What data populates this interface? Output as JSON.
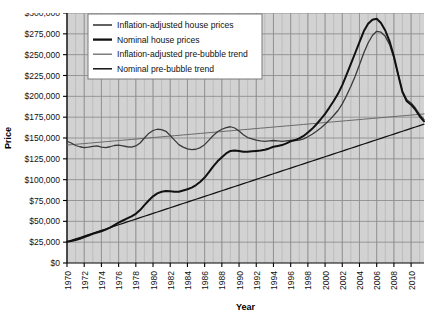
{
  "chart_data": {
    "type": "line",
    "title": "",
    "xlabel": "Year",
    "ylabel": "Price",
    "xlim": [
      1970,
      2011.5
    ],
    "ylim": [
      0,
      300000
    ],
    "grid": true,
    "legend_position": "top-left",
    "xticks": [
      1970,
      1972,
      1974,
      1976,
      1978,
      1980,
      1982,
      1984,
      1986,
      1988,
      1990,
      1992,
      1994,
      1996,
      1998,
      2000,
      2002,
      2004,
      2006,
      2008,
      2010
    ],
    "xtick_labels": [
      "1970",
      "1972",
      "1974",
      "1976",
      "1978",
      "1980",
      "1982",
      "1984",
      "1986",
      "1988",
      "1990",
      "1992",
      "1994",
      "1996",
      "1998",
      "2000",
      "2002",
      "2004",
      "2006",
      "2008",
      "2010"
    ],
    "yticks": [
      0,
      25000,
      50000,
      75000,
      100000,
      125000,
      150000,
      175000,
      200000,
      225000,
      250000,
      275000,
      300000
    ],
    "ytick_labels": [
      "$0",
      "$25,000",
      "$50,000",
      "$75,000",
      "$100,000",
      "$125,000",
      "$150,000",
      "$175,000",
      "$200,000",
      "$225,000",
      "$250,000",
      "$275,000",
      "$300,000"
    ],
    "x": [
      1970,
      1970.5,
      1971,
      1971.5,
      1972,
      1972.5,
      1973,
      1973.5,
      1974,
      1974.5,
      1975,
      1975.5,
      1976,
      1976.5,
      1977,
      1977.5,
      1978,
      1978.5,
      1979,
      1979.5,
      1980,
      1980.5,
      1981,
      1981.5,
      1982,
      1982.5,
      1983,
      1983.5,
      1984,
      1984.5,
      1985,
      1985.5,
      1986,
      1986.5,
      1987,
      1987.5,
      1988,
      1988.5,
      1989,
      1989.5,
      1990,
      1990.5,
      1991,
      1991.5,
      1992,
      1992.5,
      1993,
      1993.5,
      1994,
      1994.5,
      1995,
      1995.5,
      1996,
      1996.5,
      1997,
      1997.5,
      1998,
      1998.5,
      1999,
      1999.5,
      2000,
      2000.5,
      2001,
      2001.5,
      2002,
      2002.5,
      2003,
      2003.5,
      2004,
      2004.5,
      2005,
      2005.5,
      2006,
      2006.5,
      2007,
      2007.5,
      2008,
      2008.5,
      2009,
      2009.5,
      2010,
      2010.5,
      2011,
      2011.5
    ],
    "series": [
      {
        "name": "Inflation-adjusted house prices",
        "color": "#3a3a3a",
        "width": 1.3,
        "values": [
          146000,
          144000,
          141000,
          139500,
          138500,
          139000,
          140000,
          140500,
          139000,
          138500,
          139500,
          141000,
          141500,
          140500,
          139500,
          139000,
          140500,
          144000,
          150000,
          155500,
          159000,
          160500,
          160000,
          158000,
          153000,
          147500,
          142000,
          139000,
          137000,
          136000,
          136500,
          138500,
          142000,
          147500,
          153000,
          157500,
          160500,
          162500,
          163500,
          162000,
          158500,
          154000,
          150500,
          149000,
          147500,
          146500,
          146000,
          146500,
          147000,
          146500,
          146000,
          146500,
          147000,
          147000,
          147500,
          149000,
          151500,
          154500,
          158000,
          162000,
          166500,
          171500,
          177000,
          183000,
          191000,
          201000,
          212000,
          224000,
          238000,
          252000,
          264000,
          273000,
          278000,
          277000,
          272000,
          262000,
          246000,
          226000,
          206000,
          196000,
          192000,
          186000,
          178000,
          172000
        ]
      },
      {
        "name": "Nominal house prices",
        "color": "#111111",
        "width": 2.0,
        "values": [
          25500,
          26500,
          27500,
          29000,
          31000,
          33000,
          35000,
          36500,
          38000,
          40000,
          42500,
          45500,
          48500,
          51000,
          53500,
          56000,
          59000,
          63500,
          69500,
          75000,
          80000,
          83500,
          85500,
          86500,
          86000,
          85500,
          85500,
          87000,
          88500,
          90500,
          93500,
          97500,
          102500,
          109000,
          116000,
          122000,
          127000,
          131500,
          134500,
          135000,
          134500,
          133500,
          133500,
          134000,
          134500,
          135000,
          136000,
          137500,
          139500,
          140500,
          141500,
          143500,
          146000,
          147500,
          149500,
          152500,
          156500,
          161000,
          166500,
          172500,
          179000,
          186500,
          194500,
          203000,
          213500,
          226000,
          239000,
          252000,
          265000,
          278000,
          287000,
          292000,
          293000,
          288000,
          279000,
          266000,
          248000,
          226000,
          205000,
          194000,
          190000,
          184000,
          176000,
          170000
        ]
      },
      {
        "name": "Inflation-adjusted pre-bubble trend",
        "color": "#6a6a6a",
        "width": 1.0,
        "values": [
          141500,
          142000,
          142400,
          142900,
          143300,
          143800,
          144200,
          144700,
          145100,
          145600,
          146000,
          146500,
          146900,
          147400,
          147800,
          148300,
          148700,
          149200,
          149600,
          150100,
          150500,
          151000,
          151400,
          151900,
          152300,
          152800,
          153200,
          153700,
          154100,
          154600,
          155000,
          155500,
          155900,
          156400,
          156800,
          157300,
          157700,
          158200,
          158600,
          159100,
          159500,
          160000,
          160400,
          160900,
          161300,
          161800,
          162200,
          162700,
          163100,
          163600,
          164000,
          164500,
          164900,
          165400,
          165800,
          166300,
          166700,
          167200,
          167600,
          168100,
          168500,
          169000,
          169400,
          169900,
          170300,
          170800,
          171200,
          171700,
          172100,
          172600,
          173000,
          173500,
          173900,
          174400,
          174800,
          175300,
          175700,
          176200,
          176600,
          177100,
          177500,
          178000,
          178400,
          178900
        ]
      },
      {
        "name": "Nominal pre-bubble trend",
        "color": "#111111",
        "width": 1.2,
        "values": [
          25500,
          27200,
          28900,
          30600,
          32300,
          34000,
          35700,
          37400,
          39100,
          40800,
          42500,
          44200,
          45900,
          47600,
          49300,
          51000,
          52700,
          54400,
          56100,
          57800,
          59500,
          61200,
          62900,
          64600,
          66300,
          68000,
          69700,
          71400,
          73100,
          74800,
          76500,
          78200,
          79900,
          81600,
          83300,
          85000,
          86700,
          88400,
          90100,
          91800,
          93500,
          95200,
          96900,
          98600,
          100300,
          102000,
          103700,
          105400,
          107100,
          108800,
          110500,
          112200,
          113900,
          115600,
          117300,
          119000,
          120700,
          122400,
          124100,
          125800,
          127500,
          129200,
          130900,
          132600,
          134300,
          136000,
          137700,
          139400,
          141100,
          142800,
          144500,
          146200,
          147900,
          149600,
          151300,
          153000,
          154700,
          156400,
          158100,
          159800,
          161500,
          163200,
          164900,
          166600
        ]
      }
    ],
    "annotations": {
      "peak_year_inflation_adjusted": 2006,
      "peak_value_inflation_adjusted": 278000,
      "peak_year_nominal": 2006,
      "peak_value_nominal": 293000
    }
  },
  "legend": {
    "entries": [
      {
        "label": "Inflation-adjusted house prices"
      },
      {
        "label": "Nominal house prices"
      },
      {
        "label": "Inflation-adjusted pre-bubble trend"
      },
      {
        "label": "Nominal pre-bubble trend"
      }
    ]
  },
  "colors": {
    "plot_background": "#d2d2d2",
    "grid_minor": "#b4b4b4",
    "grid_major": "#8f8f8f",
    "axis": "#000000",
    "legend_background": "#ffffff",
    "legend_border": "#7a7a7a",
    "page_background": "#ffffff"
  }
}
